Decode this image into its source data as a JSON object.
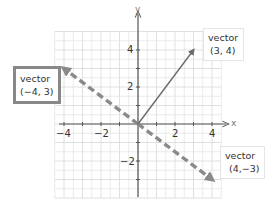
{
  "chart_data": {
    "type": "vector-plot",
    "title": "",
    "xlabel": "x",
    "ylabel": "y",
    "xlim": [
      -4.5,
      4.5
    ],
    "ylim": [
      -4,
      5
    ],
    "grid": true,
    "minor_grid_step": 0.5,
    "x_ticks": [
      -4,
      -2,
      2,
      4
    ],
    "y_ticks": [
      4,
      2,
      -2
    ],
    "vectors": [
      {
        "name": "vector (3, 4)",
        "from": [
          0,
          0
        ],
        "to": [
          3,
          4
        ],
        "style": "solid",
        "color": "#666666"
      },
      {
        "name": "vector (-4, 3)",
        "from": [
          0,
          0
        ],
        "to": [
          -4,
          3
        ],
        "style": "dashed",
        "color": "#888888"
      },
      {
        "name": "vector (4, -3)",
        "from": [
          0,
          0
        ],
        "to": [
          4,
          -3
        ],
        "style": "dashed",
        "color": "#888888"
      }
    ]
  },
  "axes": {
    "x_label": "x",
    "y_label": "y",
    "x_tick_labels": [
      "−4",
      "−2",
      "2",
      "4"
    ],
    "y_tick_labels": [
      "4",
      "2",
      "−2"
    ]
  },
  "callouts": {
    "v34": {
      "line1": "vector",
      "line2": "(3, 4)"
    },
    "vm43": {
      "line1": "vector",
      "line2": "(−4, 3)"
    },
    "v4m3": {
      "line1": "vector",
      "line2": "(4,−3)"
    }
  },
  "colors": {
    "grid": "#e6e6e6",
    "axis": "#555555",
    "solid_vector": "#6b6b6b",
    "dashed_vector": "#8a8a8a",
    "highlight_border": "#888888"
  }
}
